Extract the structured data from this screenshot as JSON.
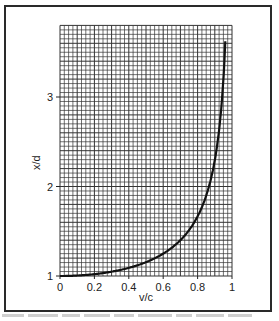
{
  "chart_data": {
    "type": "line",
    "title": "",
    "xlabel": "v/c",
    "ylabel": "x/d",
    "xlim": [
      0,
      1
    ],
    "ylim": [
      1,
      3.8
    ],
    "grid": true,
    "x_ticks": [
      "0",
      "0.2",
      "0.4",
      "0.6",
      "0.8",
      "1"
    ],
    "y_ticks": [
      "1",
      "2",
      "3"
    ],
    "series": [
      {
        "name": "x/d vs v/c",
        "x": [
          0,
          0.1,
          0.2,
          0.3,
          0.4,
          0.5,
          0.6,
          0.7,
          0.75,
          0.8,
          0.85,
          0.9,
          0.93,
          0.95,
          0.965
        ],
        "y": [
          1.0,
          1.005,
          1.02,
          1.05,
          1.09,
          1.15,
          1.25,
          1.4,
          1.51,
          1.67,
          1.9,
          2.29,
          2.72,
          3.2,
          3.8
        ]
      }
    ]
  },
  "labels": {
    "xlabel": "v/c",
    "ylabel": "x/d",
    "xticks": [
      "0",
      "0.2",
      "0.4",
      "0.6",
      "0.8",
      "1"
    ],
    "yticks": [
      "1",
      "2",
      "3"
    ]
  }
}
